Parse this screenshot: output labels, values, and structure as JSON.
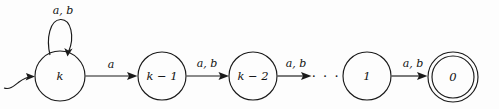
{
  "diagram": {
    "kind": "finite-state-automaton",
    "title": "",
    "alphabet": [
      "a",
      "b"
    ],
    "stroke_color": "#1a1a1a",
    "background_color": "#fdfdfd",
    "states": [
      {
        "id": "k",
        "label": "k",
        "cx": 60,
        "cy": 76,
        "r": 25,
        "accepting": false,
        "start": true
      },
      {
        "id": "k1",
        "label": "k − 1",
        "cx": 162,
        "cy": 76,
        "r": 24,
        "accepting": false,
        "start": false
      },
      {
        "id": "k2",
        "label": "k − 2",
        "cx": 253,
        "cy": 76,
        "r": 24,
        "accepting": false,
        "start": false
      },
      {
        "id": "one",
        "label": "1",
        "cx": 367,
        "cy": 76,
        "r": 24,
        "accepting": false,
        "start": false
      },
      {
        "id": "zero",
        "label": "0",
        "cx": 453,
        "cy": 77,
        "r": 25,
        "accepting": true,
        "start": false
      }
    ],
    "transitions": [
      {
        "from": "k",
        "to": "k",
        "label": "a, b",
        "kind": "self-loop",
        "label_x": 63,
        "label_y": 11
      },
      {
        "from": "k",
        "to": "k1",
        "label": "a",
        "kind": "straight",
        "label_x": 111,
        "label_y": 65
      },
      {
        "from": "k1",
        "to": "k2",
        "label": "a, b",
        "kind": "straight",
        "label_x": 207,
        "label_y": 64
      },
      {
        "from": "k2",
        "to": "one",
        "label": "a, b",
        "kind": "straight",
        "label_x": 296,
        "label_y": 64
      },
      {
        "from": "one",
        "to": "zero",
        "label": "a, b",
        "kind": "straight",
        "label_x": 413,
        "label_y": 64
      }
    ],
    "ellipsis": {
      "text": "· · ·",
      "x": 326,
      "y": 77
    },
    "start_marker": {
      "name": "start-arrow",
      "x": 12,
      "y": 84
    }
  }
}
